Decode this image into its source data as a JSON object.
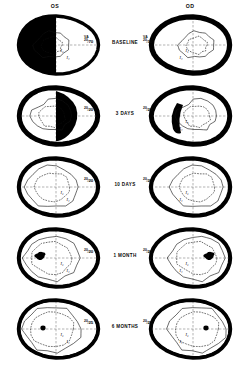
{
  "figure": {
    "headers": {
      "left_eye": "OS",
      "right_eye": "OD"
    },
    "va_tag": "VA",
    "colors": {
      "ink": "#000000",
      "paper": "#ffffff",
      "isopter": "#111111"
    }
  },
  "rows": [
    {
      "time_label": "BASELINE",
      "os": {
        "va_numerator": "20",
        "va_denominator": "70",
        "va_show_tag": true,
        "isopters": [
          "I₂",
          "I₄"
        ],
        "defect": "dense-temporal-hemianopic-scotoma",
        "defect_coverage_pct": 62
      },
      "od": {
        "va_numerator": "20",
        "va_denominator": "30",
        "va_show_tag": true,
        "isopters": [
          "I₂",
          "I₄"
        ],
        "defect": "peripheral-constriction-ring",
        "defect_coverage_pct": 30
      }
    },
    {
      "time_label": "3 DAYS",
      "os": {
        "va_numerator": "20",
        "va_denominator": "20",
        "va_show_tag": false,
        "isopters": [
          "I₂",
          "I₄"
        ],
        "defect": "residual-arcuate-scotoma",
        "defect_coverage_pct": 45
      },
      "od": {
        "va_numerator": "20",
        "va_denominator": "20",
        "va_show_tag": false,
        "isopters": [
          "I₂",
          "I₄"
        ],
        "defect": "residual-nasal-wedge",
        "defect_coverage_pct": 22
      }
    },
    {
      "time_label": "10 DAYS",
      "os": {
        "va_numerator": "20",
        "va_denominator": "20",
        "va_show_tag": false,
        "isopters": [
          "I₂",
          "I₄"
        ],
        "defect": "isopter-contraction-only",
        "defect_coverage_pct": 10
      },
      "od": {
        "va_numerator": "20",
        "va_denominator": "20",
        "va_show_tag": false,
        "isopters": [
          "I₂",
          "I₄"
        ],
        "defect": "isopter-contraction-only",
        "defect_coverage_pct": 10
      }
    },
    {
      "time_label": "1 MONTH",
      "os": {
        "va_numerator": "20",
        "va_denominator": "20",
        "va_show_tag": false,
        "isopters": [
          "I₂",
          "I₄"
        ],
        "defect": "blind-spot-enlargement",
        "defect_coverage_pct": 5
      },
      "od": {
        "va_numerator": "20",
        "va_denominator": "20",
        "va_show_tag": false,
        "isopters": [
          "I₂",
          "I₄"
        ],
        "defect": "blind-spot-enlargement",
        "defect_coverage_pct": 5
      }
    },
    {
      "time_label": "6 MONTHS",
      "os": {
        "va_numerator": "20",
        "va_denominator": "25",
        "va_show_tag": false,
        "isopters": [
          "I₂",
          "I₄"
        ],
        "defect": "physiologic-blind-spot",
        "defect_coverage_pct": 3
      },
      "od": {
        "va_numerator": "20",
        "va_denominator": "25",
        "va_show_tag": false,
        "isopters": [
          "I₂",
          "I₄"
        ],
        "defect": "physiologic-blind-spot",
        "defect_coverage_pct": 3
      }
    }
  ]
}
